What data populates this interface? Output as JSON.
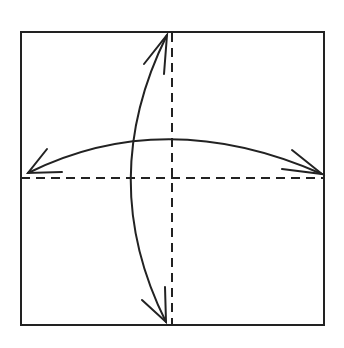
{
  "diagram": {
    "type": "origami-fold-diagram",
    "colors": {
      "line": "#222222",
      "background": "#ffffff"
    },
    "square": {
      "x": 21,
      "y": 32,
      "width": 303,
      "height": 293
    },
    "fold_lines": [
      {
        "name": "vertical-valley-fold",
        "style": "dashed",
        "x1": 172,
        "y1": 32,
        "x2": 172,
        "y2": 325
      },
      {
        "name": "horizontal-valley-fold",
        "style": "dashed",
        "x1": 21,
        "y1": 178,
        "x2": 324,
        "y2": 178
      }
    ],
    "arrows": [
      {
        "name": "horizontal-fold-unfold-arrow",
        "heads": "both"
      },
      {
        "name": "vertical-fold-unfold-arrow",
        "heads": "both"
      }
    ]
  }
}
